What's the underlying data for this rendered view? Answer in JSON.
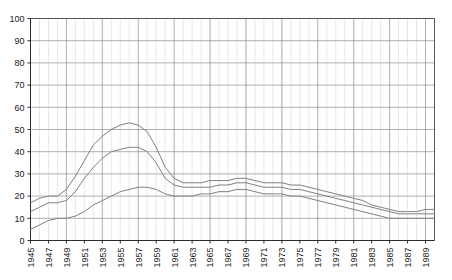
{
  "chart_data": {
    "type": "line",
    "title": "",
    "xlabel": "",
    "ylabel": "",
    "xlim": [
      1945,
      1990
    ],
    "ylim": [
      0,
      100
    ],
    "grid": true,
    "legend": "none",
    "y_ticks": [
      0,
      10,
      20,
      30,
      40,
      50,
      60,
      70,
      80,
      90,
      100
    ],
    "x_ticks": [
      1945,
      1947,
      1949,
      1951,
      1953,
      1955,
      1957,
      1959,
      1961,
      1963,
      1965,
      1967,
      1969,
      1971,
      1973,
      1975,
      1977,
      1979,
      1981,
      1983,
      1985,
      1987,
      1989
    ],
    "x": [
      1945,
      1946,
      1947,
      1948,
      1949,
      1950,
      1951,
      1952,
      1953,
      1954,
      1955,
      1956,
      1957,
      1958,
      1959,
      1960,
      1961,
      1962,
      1963,
      1964,
      1965,
      1966,
      1967,
      1968,
      1969,
      1970,
      1971,
      1972,
      1973,
      1974,
      1975,
      1976,
      1977,
      1978,
      1979,
      1980,
      1981,
      1982,
      1983,
      1984,
      1985,
      1986,
      1987,
      1988,
      1989,
      1990
    ],
    "series": [
      {
        "name": "upper",
        "color": "#808080",
        "values": [
          17,
          19,
          20,
          20,
          23,
          29,
          36,
          43,
          47,
          50,
          52,
          53,
          52,
          49,
          42,
          33,
          28,
          26,
          26,
          26,
          27,
          27,
          27,
          28,
          28,
          27,
          26,
          26,
          26,
          25,
          25,
          24,
          23,
          22,
          21,
          20,
          19,
          18,
          16,
          15,
          14,
          13,
          13,
          13,
          14,
          14
        ]
      },
      {
        "name": "middle",
        "color": "#808080",
        "values": [
          13,
          15,
          17,
          17,
          18,
          22,
          28,
          33,
          37,
          40,
          41,
          42,
          42,
          40,
          35,
          28,
          25,
          24,
          24,
          24,
          24,
          25,
          25,
          26,
          26,
          25,
          24,
          24,
          24,
          23,
          23,
          22,
          21,
          20,
          19,
          18,
          17,
          16,
          15,
          14,
          13,
          12,
          12,
          12,
          12,
          12
        ]
      },
      {
        "name": "lower",
        "color": "#808080",
        "values": [
          5,
          7,
          9,
          10,
          10,
          11,
          13,
          16,
          18,
          20,
          22,
          23,
          24,
          24,
          23,
          21,
          20,
          20,
          20,
          21,
          21,
          22,
          22,
          23,
          23,
          22,
          21,
          21,
          21,
          20,
          20,
          19,
          18,
          17,
          16,
          15,
          14,
          13,
          12,
          11,
          10,
          10,
          10,
          10,
          10,
          10
        ]
      }
    ]
  }
}
